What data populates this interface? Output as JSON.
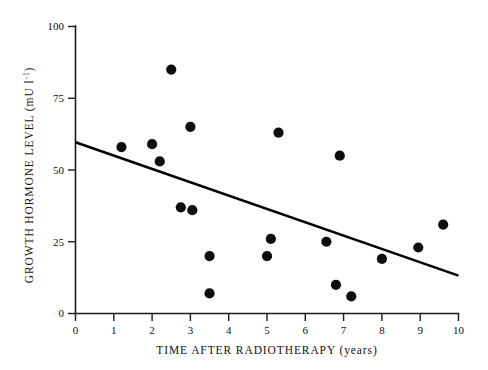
{
  "chart_data": {
    "type": "scatter",
    "title": "",
    "xlabel": "TIME AFTER RADIOTHERAPY (years)",
    "ylabel": "GROWTH HORMONE LEVEL (mU l",
    "ylabel_exponent": "-1",
    "ylabel_tail": ")",
    "xlim": [
      0,
      10
    ],
    "ylim": [
      0,
      100
    ],
    "xticks": [
      "0",
      "1",
      "2",
      "3",
      "4",
      "5",
      "6",
      "7",
      "8",
      "9",
      "10"
    ],
    "xtick_values": [
      0,
      1,
      2,
      3,
      4,
      5,
      6,
      7,
      8,
      9,
      10
    ],
    "yticks": [
      "0",
      "25",
      "50",
      "75",
      "100"
    ],
    "ytick_values": [
      0,
      25,
      50,
      75,
      100
    ],
    "grid": false,
    "legend": null,
    "marker": "filled-circle",
    "marker_color": "#0d0d0d",
    "points": [
      {
        "x": 1.2,
        "y": 58
      },
      {
        "x": 2.0,
        "y": 59
      },
      {
        "x": 2.2,
        "y": 53
      },
      {
        "x": 2.5,
        "y": 85
      },
      {
        "x": 2.75,
        "y": 37
      },
      {
        "x": 3.0,
        "y": 65
      },
      {
        "x": 3.05,
        "y": 36
      },
      {
        "x": 3.5,
        "y": 20
      },
      {
        "x": 3.5,
        "y": 7
      },
      {
        "x": 5.0,
        "y": 20
      },
      {
        "x": 5.1,
        "y": 26
      },
      {
        "x": 5.3,
        "y": 63
      },
      {
        "x": 6.55,
        "y": 25
      },
      {
        "x": 6.8,
        "y": 10
      },
      {
        "x": 6.9,
        "y": 55
      },
      {
        "x": 7.2,
        "y": 6
      },
      {
        "x": 8.0,
        "y": 19
      },
      {
        "x": 8.95,
        "y": 23
      },
      {
        "x": 9.6,
        "y": 31
      }
    ],
    "trend_line": {
      "type": "linear-regression",
      "x_start": 0,
      "y_start": 59.7,
      "x_end": 10,
      "y_end": 13.2,
      "color": "#000000"
    }
  }
}
